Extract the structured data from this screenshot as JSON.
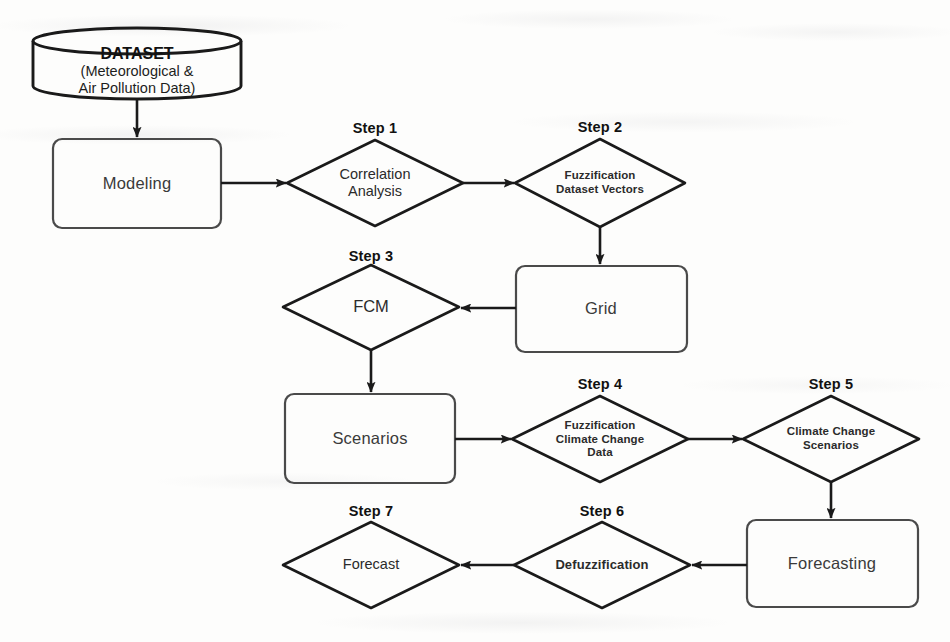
{
  "diagram": {
    "type": "flowchart",
    "background_color": "#fdfdfc",
    "stroke_color": "#1a1a1a",
    "nodes": [
      {
        "id": "dataset",
        "shape": "cylinder",
        "title": "DATASET",
        "subtitle_line1": "(Meteorological &",
        "subtitle_line2": "Air Pollution Data)",
        "step": ""
      },
      {
        "id": "modeling",
        "shape": "process",
        "label": "Modeling",
        "step": ""
      },
      {
        "id": "correlation-analysis",
        "shape": "decision",
        "label": "Correlation\nAnalysis",
        "step": "Step 1"
      },
      {
        "id": "fuzzification-dataset-vectors",
        "shape": "decision",
        "label": "Fuzzification\nDataset Vectors",
        "step": "Step 2"
      },
      {
        "id": "grid",
        "shape": "process",
        "label": "Grid",
        "step": ""
      },
      {
        "id": "fcm",
        "shape": "decision",
        "label": "FCM",
        "step": "Step 3"
      },
      {
        "id": "scenarios",
        "shape": "process",
        "label": "Scenarios",
        "step": ""
      },
      {
        "id": "fuzzification-climate-change-data",
        "shape": "decision",
        "label": "Fuzzification\nClimate Change\nData",
        "step": "Step 4"
      },
      {
        "id": "climate-change-scenarios",
        "shape": "decision",
        "label": "Climate Change\nScenarios",
        "step": "Step 5"
      },
      {
        "id": "forecasting",
        "shape": "process",
        "label": "Forecasting",
        "step": ""
      },
      {
        "id": "defuzzification",
        "shape": "decision",
        "label": "Defuzzification",
        "step": "Step 6"
      },
      {
        "id": "forecast",
        "shape": "decision",
        "label": "Forecast",
        "step": "Step 7"
      }
    ],
    "edges": [
      {
        "from": "dataset",
        "to": "modeling",
        "direction": "down"
      },
      {
        "from": "modeling",
        "to": "correlation-analysis",
        "direction": "right"
      },
      {
        "from": "correlation-analysis",
        "to": "fuzzification-dataset-vectors",
        "direction": "right"
      },
      {
        "from": "fuzzification-dataset-vectors",
        "to": "grid",
        "direction": "down"
      },
      {
        "from": "grid",
        "to": "fcm",
        "direction": "left"
      },
      {
        "from": "fcm",
        "to": "scenarios",
        "direction": "down"
      },
      {
        "from": "scenarios",
        "to": "fuzzification-climate-change-data",
        "direction": "right"
      },
      {
        "from": "fuzzification-climate-change-data",
        "to": "climate-change-scenarios",
        "direction": "right"
      },
      {
        "from": "climate-change-scenarios",
        "to": "forecasting",
        "direction": "down"
      },
      {
        "from": "forecasting",
        "to": "defuzzification",
        "direction": "left"
      },
      {
        "from": "defuzzification",
        "to": "forecast",
        "direction": "left"
      }
    ]
  }
}
